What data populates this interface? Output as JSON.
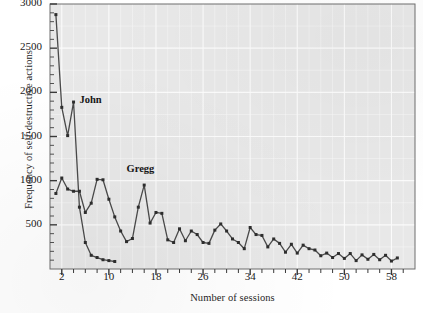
{
  "chart_data": {
    "type": "line",
    "title": "",
    "xlabel": "Number of sessions",
    "ylabel": "Frequency of self-destructive actions",
    "xlim": [
      0,
      62
    ],
    "ylim": [
      0,
      3000
    ],
    "xticks": [
      2,
      10,
      18,
      26,
      34,
      42,
      50,
      58
    ],
    "yticks": [
      500,
      1000,
      1500,
      2000,
      2500,
      3000
    ],
    "ytick_minor_step": 100,
    "grid": true,
    "legend": "inline-annotation",
    "line_color": "#4a4a4a",
    "marker_color": "#2e2e2e",
    "plot_background": "#e8e8e8",
    "grid_color": "#fdfdfd",
    "series": [
      {
        "name": "John",
        "label_x": 5.0,
        "label_y": 1900,
        "x": [
          1,
          2,
          3,
          4,
          5,
          6,
          7,
          8,
          9,
          10,
          11
        ],
        "values": [
          2880,
          1830,
          1510,
          1890,
          700,
          300,
          155,
          130,
          105,
          95,
          85
        ]
      },
      {
        "name": "Gregg",
        "label_x": 13.0,
        "label_y": 1120,
        "x": [
          1,
          2,
          3,
          4,
          5,
          6,
          7,
          8,
          9,
          10,
          11,
          12,
          13,
          14,
          15,
          16,
          17,
          18,
          19,
          20,
          21,
          22,
          23,
          24,
          25,
          26,
          27,
          28,
          29,
          30,
          31,
          32,
          33,
          34,
          35,
          36,
          37,
          38,
          39,
          40,
          41,
          42,
          43,
          44,
          45,
          46,
          47,
          48,
          49,
          50,
          51,
          52,
          53,
          54,
          55,
          56,
          57,
          58,
          59
        ],
        "values": [
          855,
          1030,
          905,
          880,
          880,
          640,
          745,
          1015,
          1010,
          790,
          590,
          430,
          310,
          345,
          700,
          950,
          520,
          640,
          630,
          330,
          300,
          455,
          320,
          430,
          390,
          300,
          290,
          440,
          510,
          430,
          340,
          300,
          230,
          470,
          390,
          380,
          250,
          340,
          290,
          190,
          280,
          180,
          270,
          230,
          215,
          150,
          180,
          130,
          175,
          120,
          175,
          95,
          160,
          110,
          165,
          105,
          155,
          90,
          125
        ]
      }
    ]
  }
}
